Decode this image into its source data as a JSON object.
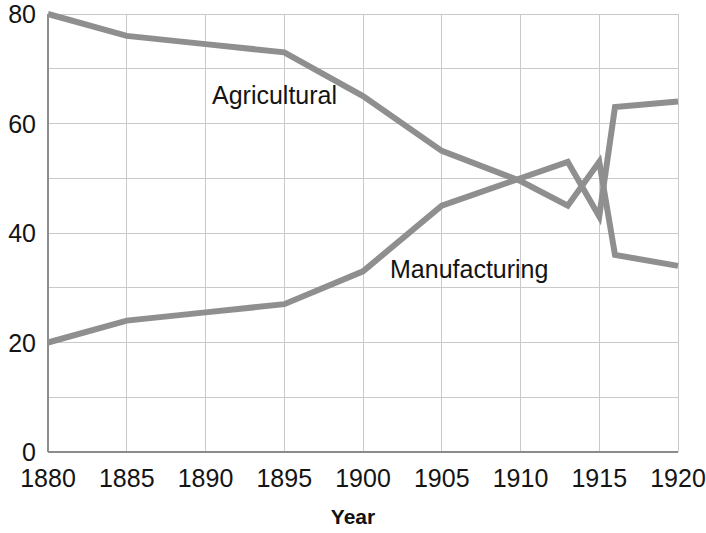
{
  "chart_data": {
    "type": "line",
    "title": "",
    "subtitle": "",
    "xlabel": "Year",
    "ylabel": "",
    "xlim": [
      1880,
      1920
    ],
    "ylim": [
      0,
      80
    ],
    "x_ticks": [
      "1880",
      "1885",
      "1890",
      "1895",
      "1900",
      "1905",
      "1910",
      "1915",
      "1920"
    ],
    "x_tick_values": [
      1880,
      1885,
      1890,
      1895,
      1900,
      1905,
      1910,
      1915,
      1920
    ],
    "y_ticks": [
      "0",
      "20",
      "40",
      "60",
      "80"
    ],
    "y_tick_values": [
      0,
      20,
      40,
      60,
      80
    ],
    "y_minor_gridlines": [
      10,
      30,
      50,
      70
    ],
    "grid": true,
    "legend_position": "inline-annotations",
    "line_color": "#8f8f8f",
    "grid_color": "#c9c9c9",
    "axis_color": "#8c8c8c",
    "series": [
      {
        "name": "Agricultural",
        "label": "Agricultural",
        "color": "#8f8f8f",
        "x": [
          1880,
          1885,
          1890,
          1895,
          1900,
          1905,
          1910,
          1913,
          1915,
          1916,
          1920
        ],
        "values": [
          80,
          76,
          74.5,
          73,
          65,
          55,
          49.5,
          45,
          53,
          36,
          34
        ]
      },
      {
        "name": "Manufacturing",
        "label": "Manufacturing",
        "color": "#8f8f8f",
        "x": [
          1880,
          1885,
          1890,
          1895,
          1900,
          1905,
          1910,
          1913,
          1915,
          1916,
          1920
        ],
        "values": [
          20,
          24,
          25.5,
          27,
          33,
          45,
          50,
          53,
          43,
          63,
          64
        ]
      }
    ],
    "annotations": [
      {
        "text": "Agricultural",
        "x": 1893,
        "y": 60
      },
      {
        "text": "Manufacturing",
        "x": 1905,
        "y": 33
      }
    ]
  },
  "axis": {
    "x_title": "Year"
  }
}
